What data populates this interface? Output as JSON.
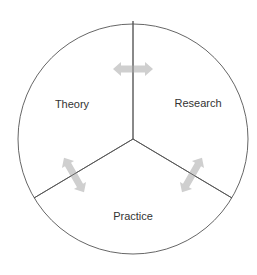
{
  "diagram": {
    "type": "three-sector-circle",
    "sectors": [
      {
        "id": "theory",
        "label": "Theory"
      },
      {
        "id": "research",
        "label": "Research"
      },
      {
        "id": "practice",
        "label": "Practice"
      }
    ],
    "connections": [
      {
        "between": [
          "theory",
          "research"
        ],
        "type": "bidirectional-arrow"
      },
      {
        "between": [
          "theory",
          "practice"
        ],
        "type": "bidirectional-arrow"
      },
      {
        "between": [
          "research",
          "practice"
        ],
        "type": "bidirectional-arrow"
      }
    ],
    "colors": {
      "outline": "#555555",
      "divider": "#555555",
      "arrow": "#cfcfcf",
      "text": "#333333",
      "background": "#ffffff"
    }
  }
}
